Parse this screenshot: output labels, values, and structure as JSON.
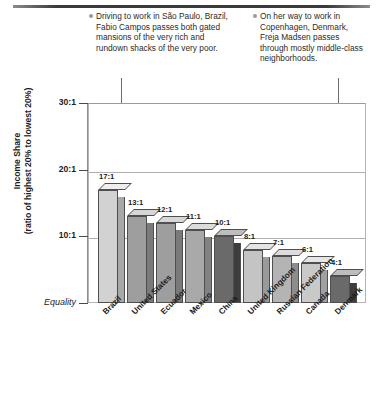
{
  "annotations": [
    {
      "id": "sao-paulo-note",
      "text": "Driving to work in São Paulo, Brazil, Fabio Campos passes both gated mansions of the very rich and rundown shacks of the very poor.",
      "points_to": "Brazil"
    },
    {
      "id": "copenhagen-note",
      "text": "On her way to work in Copenhagen, Denmark, Freja Madsen passes through mostly middle-class neighborhoods.",
      "points_to": "Denmark"
    }
  ],
  "axis": {
    "y_title_line1": "Income Share",
    "y_title_line2": "(ratio of highest 20% to lowest 20%)",
    "tick_labels": [
      "30:1",
      "20:1",
      "10:1",
      "Equality"
    ]
  },
  "chart_data": {
    "type": "bar",
    "title": "",
    "xlabel": "",
    "ylabel": "Income Share (ratio of highest 20% to lowest 20%)",
    "ylim": [
      0,
      30
    ],
    "yticks": [
      30,
      20,
      10,
      0
    ],
    "ytick_labels": [
      "30:1",
      "20:1",
      "10:1",
      "Equality"
    ],
    "grid": true,
    "legend": "none",
    "categories": [
      "Brazil",
      "United States",
      "Ecuador",
      "Mexico",
      "China",
      "United Kingdom",
      "Russian Federation",
      "Canada",
      "Denmark"
    ],
    "values": [
      17,
      13,
      12,
      11,
      10,
      8,
      7,
      6,
      4
    ],
    "data_labels": [
      "17:1",
      "13:1",
      "12:1",
      "11:1",
      "10:1",
      "8:1",
      "7:1",
      "6:1",
      "4:1"
    ],
    "bar_colors": [
      "#d2d2d2",
      "#9e9e9e",
      "#9e9e9e",
      "#a9a9a9",
      "#6a6a6a",
      "#c4c4c4",
      "#b4b4b4",
      "#c9c9c9",
      "#6a6a6a"
    ],
    "bar_top_colors": [
      "#eeeeee",
      "#d6d6d6",
      "#d6d6d6",
      "#dcdcdc",
      "#bdbdbd",
      "#e4e4e4",
      "#dcdcdc",
      "#e6e6e6",
      "#bdbdbd"
    ],
    "bar_side_colors": [
      "#a8a8a8",
      "#7a7a7a",
      "#7a7a7a",
      "#828282",
      "#3d3d3d",
      "#9a9a9a",
      "#8d8d8d",
      "#a0a0a0",
      "#3d3d3d"
    ]
  }
}
